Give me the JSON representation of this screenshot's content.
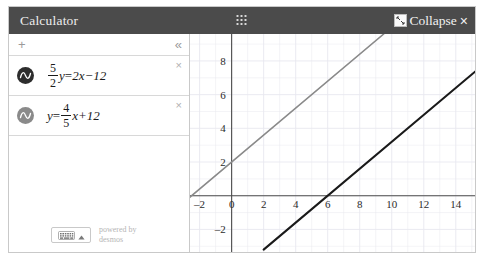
{
  "window": {
    "title": "Calculator",
    "drag_handle_icon": "grid-dots-icon",
    "collapse_icon": "collapse-arrows-icon",
    "collapse_label": "Collapse",
    "close_label": "×",
    "header_bg": "#4b4b4b"
  },
  "expression_panel": {
    "toolbar": {
      "add_label": "+",
      "collapse_label": "«"
    },
    "expressions": [
      {
        "index": 1,
        "icon": "sine-wave-circle-icon",
        "color": "#2d2d2d",
        "delete_label": "×",
        "latex": "5/2 y = 2x - 12",
        "lhs_fraction_num": "5",
        "lhs_fraction_den": "2",
        "lhs_var": "y",
        "equals": "=",
        "rhs": "2x−12"
      },
      {
        "index": 2,
        "icon": "sine-wave-circle-icon",
        "color": "#8a8a8a",
        "delete_label": "×",
        "latex": "y = 4/5 x + 12",
        "lhs_var": "y",
        "equals": "=",
        "rhs_fraction_num": "4",
        "rhs_fraction_den": "5",
        "rhs_tail": "x+12"
      }
    ],
    "footer": {
      "keyboard_icon": "keyboard-icon",
      "caret_icon": "caret-up-icon",
      "powered_line1": "powered by",
      "powered_line2": "desmos"
    }
  },
  "chart_data": {
    "type": "line",
    "title": "",
    "xlabel": "",
    "ylabel": "",
    "xlim": [
      -2.6,
      15.2
    ],
    "ylim": [
      -3.4,
      9.6
    ],
    "grid": true,
    "legend": "none",
    "xticks": [
      -2,
      0,
      2,
      4,
      6,
      8,
      10,
      12,
      14
    ],
    "yticks": [
      8,
      6,
      4,
      2,
      0,
      -2
    ],
    "xtick_labels": [
      "–2",
      "0",
      "2",
      "4",
      "6",
      "8",
      "10",
      "12",
      "14"
    ],
    "ytick_labels": [
      "8",
      "6",
      "4",
      "2",
      "0",
      "–2"
    ],
    "axis_color": "#4b4b4b",
    "grid_color": "#e8e8ef",
    "series": [
      {
        "name": "y = 4/5 x + 12",
        "color": "#8a8a8a",
        "slope": 0.8,
        "intercept": 2,
        "points": [
          [
            -2.6,
            -0.08
          ],
          [
            9.5,
            9.6
          ]
        ],
        "style": "solid",
        "width": 1.6
      },
      {
        "name": "5/2 y = 2x − 12",
        "color": "#1a1a1a",
        "slope": 0.8,
        "intercept": -4.8,
        "points": [
          [
            2.0,
            -3.2
          ],
          [
            15.2,
            7.36
          ]
        ],
        "style": "solid",
        "width": 2.1
      }
    ]
  }
}
